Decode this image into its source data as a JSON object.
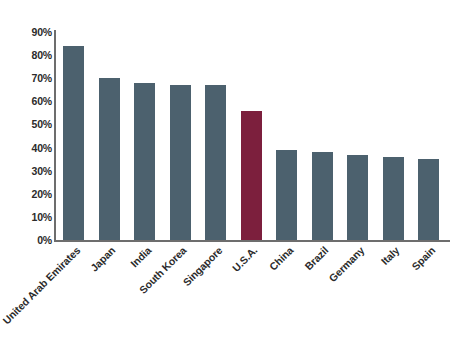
{
  "chart_data": {
    "type": "bar",
    "title": "",
    "subtitle": "",
    "xlabel": "",
    "ylabel": "",
    "categories": [
      "United Arab Emirates",
      "Japan",
      "India",
      "South Korea",
      "Singapore",
      "U.S.A.",
      "China",
      "Brazil",
      "Germany",
      "Italy",
      "Spain"
    ],
    "values": [
      84,
      70,
      68,
      67,
      67,
      56,
      39,
      38,
      37,
      36,
      35
    ],
    "value_suffix": "%",
    "ylim": [
      0,
      90
    ],
    "ytick_values": [
      0,
      10,
      20,
      30,
      40,
      50,
      60,
      70,
      80,
      90
    ],
    "ytick_labels": [
      "0%",
      "10%",
      "20%",
      "30%",
      "40%",
      "50%",
      "60%",
      "70%",
      "80%",
      "90%"
    ],
    "grid": false,
    "legend": null,
    "bar_color": "#4c616e",
    "highlight_color": "#7c1f3d",
    "highlight_category": "U.S.A.",
    "axis_color": "#6d6d6d",
    "background_color": "#ffffff",
    "xtick_rotation_deg": -45
  }
}
